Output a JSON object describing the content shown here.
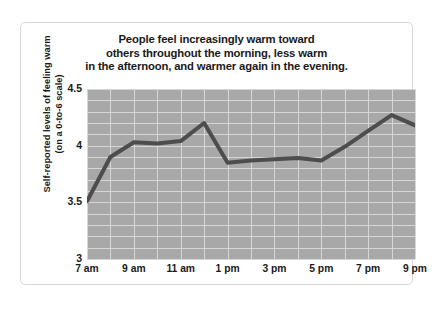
{
  "chart_data": {
    "type": "line",
    "title": "People feel increasingly warm toward others throughout the morning, less warm in the afternoon, and warmer again in the evening.",
    "title_lines": [
      "People feel increasingly warm toward",
      "others throughout the morning, less warm",
      "in the afternoon, and warmer again in the evening."
    ],
    "xlabel": "",
    "ylabel": "Self-reported levels of feeling warm (on a 0-to-6 scale)",
    "ylabel_lines": [
      "Self-reported levels of feeling warm",
      "(on a 0-to-6 scale)"
    ],
    "ylim": [
      3,
      4.5
    ],
    "y_ticks": [
      "3",
      "3.5",
      "4",
      "4.5"
    ],
    "y_tick_values": [
      3,
      3.5,
      4,
      4.5
    ],
    "x_ticks": [
      "7 am",
      "9 am",
      "11 am",
      "1 pm",
      "3 pm",
      "5 pm",
      "7 pm",
      "9 pm"
    ],
    "x_tick_values": [
      7,
      9,
      11,
      13,
      15,
      17,
      19,
      21
    ],
    "xlim": [
      7,
      21
    ],
    "grid": true,
    "legend": "none",
    "categories": [
      "7 am",
      "8 am",
      "9 am",
      "10 am",
      "11 am",
      "12 pm",
      "1 pm",
      "2 pm",
      "3 pm",
      "4 pm",
      "5 pm",
      "6 pm",
      "7 pm",
      "8 pm",
      "9 pm"
    ],
    "x": [
      7,
      8,
      9,
      10,
      11,
      12,
      13,
      14,
      15,
      16,
      17,
      18,
      19,
      20,
      21
    ],
    "values": [
      3.51,
      3.9,
      4.03,
      4.02,
      4.04,
      4.2,
      3.85,
      3.87,
      3.88,
      3.89,
      3.87,
      3.99,
      4.13,
      4.27,
      4.18
    ],
    "line_color": "#4d4d4d",
    "line_width": 4,
    "plot_background": "#a8a8a8",
    "grid_color": "#d6d6d6",
    "figure_background": "#ffffff",
    "border_color": "#d8d8d8",
    "text_color": "#1a1a1a",
    "grid_y_step": 0.1,
    "grid_x_step": 1
  }
}
